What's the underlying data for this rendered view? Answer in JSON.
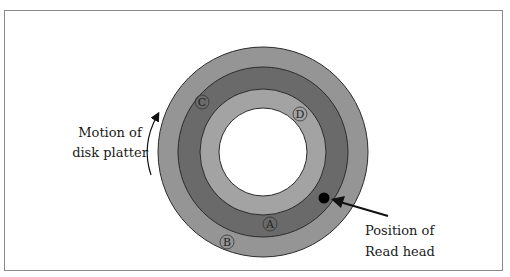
{
  "diagram": {
    "type": "disk-platter",
    "colors": {
      "outer_ring": "#959595",
      "middle_ring": "#6a6a6a",
      "inner_ring": "#a3a3a3",
      "hole": "#ffffff",
      "outline": "#2b2b2b",
      "read_head": "#000000"
    },
    "tracks": [
      {
        "label": "A",
        "ring": "middle"
      },
      {
        "label": "B",
        "ring": "outer"
      },
      {
        "label": "C",
        "ring": "middle"
      },
      {
        "label": "D",
        "ring": "inner"
      }
    ],
    "left_caption": {
      "line1": "Motion of",
      "line2": "disk platter"
    },
    "right_caption": {
      "line1": "Position of",
      "line2": "Read head"
    }
  }
}
